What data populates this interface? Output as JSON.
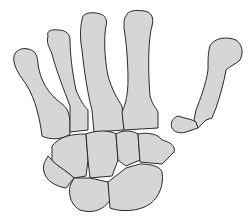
{
  "figure": {
    "colors": {
      "bone_fill": "#d6d6d6",
      "outline": "#2a2a2a",
      "background": "#ffffff"
    },
    "parts": [
      {
        "id": "metacarpal-1",
        "label": ""
      },
      {
        "id": "metacarpal-2",
        "label": ""
      },
      {
        "id": "metacarpal-3",
        "label": ""
      },
      {
        "id": "metacarpal-4",
        "label": ""
      },
      {
        "id": "carpal-bones",
        "label": ""
      },
      {
        "id": "fractured-phalanx",
        "label": ""
      }
    ]
  }
}
